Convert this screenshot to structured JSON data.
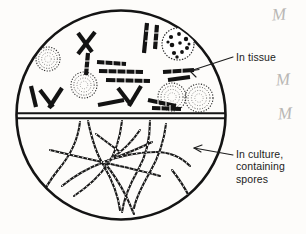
{
  "figure": {
    "background_color": "#fdfcfa",
    "ink_color": "#161616",
    "circle": {
      "center_x": 121,
      "center_y": 115,
      "radius": 105,
      "stroke_width": 2.6
    },
    "divider": {
      "description": "double horizontal line splitting circle into tissue phase (top) and culture phase (bottom)",
      "y_upper": 113,
      "y_lower": 118
    }
  },
  "labels": {
    "in_tissue": {
      "text": "In tissue",
      "lines": [
        "In tissue"
      ],
      "arrow_from_x": 233,
      "arrow_from_y": 57,
      "arrow_to_x": 186,
      "arrow_to_y": 73
    },
    "in_culture": {
      "text": "In culture,\ncontaining\nspores",
      "lines": [
        "In culture,",
        "containing",
        "spores"
      ],
      "arrow_from_x": 233,
      "arrow_from_y": 155,
      "arrow_to_x": 192,
      "arrow_to_y": 148
    }
  },
  "margin_marks": [
    {
      "glyph": "M",
      "name": "handwritten-mark-1"
    },
    {
      "glyph": "M",
      "name": "handwritten-mark-2"
    },
    {
      "glyph": "M",
      "name": "handwritten-mark-3"
    }
  ],
  "tissue_phase": {
    "name": "tissue-phase-region",
    "caption": "In tissue",
    "spherules": [
      {
        "cx": 48,
        "cy": 59,
        "r": 12,
        "style": "stippled",
        "name": "spherule-stippled-1"
      },
      {
        "cx": 84,
        "cy": 85,
        "r": 13,
        "style": "stippled",
        "name": "spherule-stippled-2"
      },
      {
        "cx": 178,
        "cy": 44,
        "r": 16,
        "style": "endospores",
        "name": "spherule-with-endospores"
      },
      {
        "cx": 172,
        "cy": 97,
        "r": 14,
        "style": "stippled",
        "name": "spherule-stippled-3"
      },
      {
        "cx": 198,
        "cy": 98,
        "r": 14,
        "style": "stippled",
        "name": "spherule-stippled-4"
      }
    ],
    "hyphal_fragments": [
      {
        "name": "fragment-x-cross-1",
        "points": "78,33 92,52"
      },
      {
        "name": "fragment-x-cross-2",
        "points": "95,32 78,54"
      },
      {
        "name": "fragment-vertical-1",
        "points": "88,52 86,74"
      },
      {
        "name": "fragment-bar-1",
        "points": "97,62 126,64"
      },
      {
        "name": "fragment-bar-2",
        "points": "99,71 143,72"
      },
      {
        "name": "fragment-bar-3",
        "points": "106,79 150,81"
      },
      {
        "name": "fragment-vertical-right-1",
        "points": "147,23 144,53"
      },
      {
        "name": "fragment-vertical-right-2",
        "points": "157,24 155,48"
      },
      {
        "name": "fragment-chevron-left",
        "points": "40,90 53,106"
      },
      {
        "name": "fragment-chevron-left-2",
        "points": "62,88 49,108"
      },
      {
        "name": "fragment-slash-left",
        "points": "31,86 36,107"
      },
      {
        "name": "fragment-chevron-mid",
        "points": "118,88 131,105"
      },
      {
        "name": "fragment-chevron-mid-2",
        "points": "140,86 129,106"
      },
      {
        "name": "fragment-bar-4",
        "points": "98,104 124,100"
      },
      {
        "name": "fragment-bar-5",
        "points": "148,99 176,105"
      },
      {
        "name": "fragment-bar-6",
        "points": "152,107 180,108"
      },
      {
        "name": "fragment-arrow-bar-1",
        "points": "163,72 194,70"
      },
      {
        "name": "fragment-arrow-bar-2",
        "points": "168,79 189,76"
      }
    ]
  },
  "culture_phase": {
    "name": "culture-phase-region",
    "caption": "In culture, containing spores",
    "description": "branching septate hyphae bearing barrel-shaped arthrospores",
    "hyphae": [
      {
        "name": "hypha-1",
        "path": "M 80,122 C 78,140 70,156 58,170 C 50,180 44,190 40,200"
      },
      {
        "name": "hypha-2",
        "path": "M 88,121 C 92,140 96,154 104,166 C 112,180 118,194 120,210"
      },
      {
        "name": "hypha-3",
        "path": "M 122,121 C 120,138 116,152 108,164 C 98,178 86,188 74,196"
      },
      {
        "name": "hypha-4",
        "path": "M 150,121 C 150,140 146,156 138,170 C 130,184 124,198 122,212"
      },
      {
        "name": "hypha-5",
        "path": "M 166,124 C 164,142 158,158 150,172 C 142,186 136,198 134,208"
      },
      {
        "name": "hypha-6",
        "path": "M 50,150 C 66,154 84,158 102,162 C 120,166 140,170 160,176"
      },
      {
        "name": "hypha-7",
        "path": "M 62,186 C 74,176 88,168 104,162 C 120,156 136,150 152,142"
      },
      {
        "name": "hypha-8",
        "path": "M 104,162 C 120,156 138,152 156,152 C 170,152 182,158 190,166"
      },
      {
        "name": "hypha-9",
        "path": "M 104,162 C 112,172 120,184 126,196 C 130,204 132,210 134,214"
      },
      {
        "name": "hypha-10",
        "path": "M 96,134 C 104,140 112,146 120,152"
      },
      {
        "name": "hypha-11",
        "path": "M 140,130 C 132,142 124,150 112,158"
      },
      {
        "name": "hypha-12",
        "path": "M 172,170 C 180,180 186,190 190,198"
      }
    ]
  }
}
